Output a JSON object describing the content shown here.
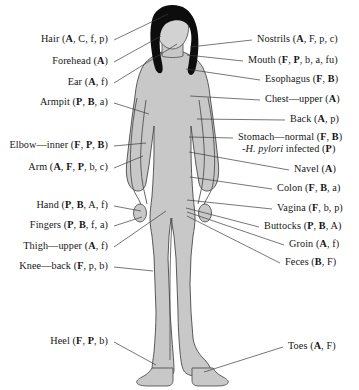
{
  "figure": {
    "width": 359,
    "height": 390,
    "background_color": "#ffffff",
    "body_fill_color": "#c8c8c8",
    "body_outline_color": "#4a4a4a",
    "hair_color": "#0d0d0d",
    "face_fill_color": "#d2d2d2",
    "leader_line_color": "#3c3c3c",
    "text_color": "#161616"
  },
  "labels_left": [
    {
      "name": "hair",
      "text": "Hair (A, C, f, p)",
      "site": "Hair",
      "codes": "A, C, f, p",
      "bold_codes": "A",
      "x_right": 108,
      "y": 38,
      "anchor_x": 168,
      "anchor_y": 14
    },
    {
      "name": "forehead",
      "text": "Forehead (A)",
      "site": "Forehead",
      "codes": "A",
      "bold_codes": "A",
      "x_right": 108,
      "y": 60,
      "anchor_x": 161,
      "anchor_y": 36
    },
    {
      "name": "ear",
      "text": "Ear (A, f)",
      "site": "Ear",
      "codes": "A, f",
      "bold_codes": "A",
      "x_right": 108,
      "y": 81,
      "anchor_x": 176,
      "anchor_y": 44
    },
    {
      "name": "armpit",
      "text": "Armpit (P, B, a)",
      "site": "Armpit",
      "codes": "P, B, a",
      "bold_codes": "P, B",
      "x_right": 108,
      "y": 101,
      "anchor_x": 148,
      "anchor_y": 113
    },
    {
      "name": "elbow-inner",
      "text": "Elbow—inner (F, P, B)",
      "site": "Elbow—inner",
      "codes": "F, P, B",
      "bold_codes": "F, P, B",
      "x_right": 108,
      "y": 144,
      "anchor_x": 145,
      "anchor_y": 143
    },
    {
      "name": "arm",
      "text": "Arm (A, F, P, b, c)",
      "site": "Arm",
      "codes": "A, F, P, b, c",
      "bold_codes": "A, F, P",
      "x_right": 108,
      "y": 166,
      "anchor_x": 142,
      "anchor_y": 155
    },
    {
      "name": "hand",
      "text": "Hand (P, B, A, f)",
      "site": "Hand",
      "codes": "P, B, A, f",
      "bold_codes": "P, B",
      "x_right": 108,
      "y": 204,
      "anchor_x": 142,
      "anchor_y": 210
    },
    {
      "name": "fingers",
      "text": "Fingers (P, B, f, a)",
      "site": "Fingers",
      "codes": "P, B, f, a",
      "bold_codes": "P, B",
      "x_right": 108,
      "y": 224,
      "anchor_x": 143,
      "anchor_y": 216
    },
    {
      "name": "thigh-upper",
      "text": "Thigh—upper (A, f)",
      "site": "Thigh—upper",
      "codes": "A, f",
      "bold_codes": "A",
      "x_right": 108,
      "y": 245,
      "anchor_x": 167,
      "anchor_y": 210
    },
    {
      "name": "knee-back",
      "text": "Knee—back (F, p, b)",
      "site": "Knee—back",
      "codes": "F, p, b",
      "bold_codes": "F",
      "x_right": 108,
      "y": 265,
      "anchor_x": 152,
      "anchor_y": 269
    },
    {
      "name": "heel",
      "text": "Heel (F, P, b)",
      "site": "Heel",
      "codes": "F, P, b",
      "bold_codes": "F, P",
      "x_right": 108,
      "y": 340,
      "anchor_x": 155,
      "anchor_y": 363
    }
  ],
  "labels_right": [
    {
      "name": "nostrils",
      "text": "Nostrils (A, F, p, c)",
      "site": "Nostrils",
      "codes": "A, F, p, c",
      "bold_codes": "A",
      "x_left": 257,
      "y": 38,
      "anchor_x": 190,
      "anchor_y": 47
    },
    {
      "name": "mouth",
      "text": "Mouth (F, P, b, a, fu)",
      "site": "Mouth",
      "codes": "F, P, b, a, fu",
      "bold_codes": "F, P",
      "x_left": 248,
      "y": 59,
      "anchor_x": 187,
      "anchor_y": 54
    },
    {
      "name": "esophagus",
      "text": "Esophagus (F, B)",
      "site": "Esophagus",
      "codes": "F, B",
      "bold_codes": "F, B",
      "x_left": 265,
      "y": 78,
      "anchor_x": 186,
      "anchor_y": 68
    },
    {
      "name": "chest-upper",
      "text": "Chest—upper (A)",
      "site": "Chest—upper",
      "codes": "A",
      "bold_codes": "A",
      "x_left": 265,
      "y": 98,
      "anchor_x": 190,
      "anchor_y": 96
    },
    {
      "name": "back",
      "text": "Back (A, p)",
      "site": "Back",
      "codes": "A, p",
      "bold_codes": "A",
      "x_left": 290,
      "y": 118,
      "anchor_x": 196,
      "anchor_y": 119
    },
    {
      "name": "stomach-normal",
      "text": "Stomach—normal (F, B)",
      "site": "Stomach—normal",
      "codes": "F, B",
      "bold_codes": "F, B",
      "x_left": 238,
      "y": 136,
      "anchor_x": 188,
      "anchor_y": 136
    },
    {
      "name": "h-pylori-infected",
      "text": "-H. pylori infected (P)",
      "site": "H. pylori infected",
      "codes": "P",
      "bold_codes": "P",
      "italic_part": "H. pylori",
      "x_left": 242,
      "y": 148,
      "anchor_x": 0,
      "anchor_y": 0
    },
    {
      "name": "navel",
      "text": "Navel (A)",
      "site": "Navel",
      "codes": "A",
      "bold_codes": "A",
      "x_left": 294,
      "y": 168,
      "anchor_x": 188,
      "anchor_y": 152
    },
    {
      "name": "colon",
      "text": "Colon (F, B, a)",
      "site": "Colon",
      "codes": "F, B, a",
      "bold_codes": "F, B",
      "x_left": 277,
      "y": 187,
      "anchor_x": 189,
      "anchor_y": 176
    },
    {
      "name": "vagina",
      "text": "Vagina (F, b, p)",
      "site": "Vagina",
      "codes": "F, b, p",
      "bold_codes": "F",
      "x_left": 277,
      "y": 207,
      "anchor_x": 186,
      "anchor_y": 199
    },
    {
      "name": "buttocks",
      "text": "Buttocks (P, B, A)",
      "site": "Buttocks",
      "codes": "P, B, A",
      "bold_codes": "P, B",
      "x_left": 264,
      "y": 225,
      "anchor_x": 186,
      "anchor_y": 207
    },
    {
      "name": "groin",
      "text": "Groin (A, f)",
      "site": "Groin",
      "codes": "A, f",
      "bold_codes": "A",
      "x_left": 289,
      "y": 243,
      "anchor_x": 186,
      "anchor_y": 211
    },
    {
      "name": "feces",
      "text": "Feces (B, F)",
      "site": "Feces",
      "codes": "B, F",
      "bold_codes": "B",
      "x_left": 285,
      "y": 261,
      "anchor_x": 186,
      "anchor_y": 215
    },
    {
      "name": "toes",
      "text": "Toes (A, F)",
      "site": "Toes",
      "codes": "A, F",
      "bold_codes": "A",
      "x_left": 288,
      "y": 345,
      "anchor_x": 203,
      "anchor_y": 370
    }
  ]
}
